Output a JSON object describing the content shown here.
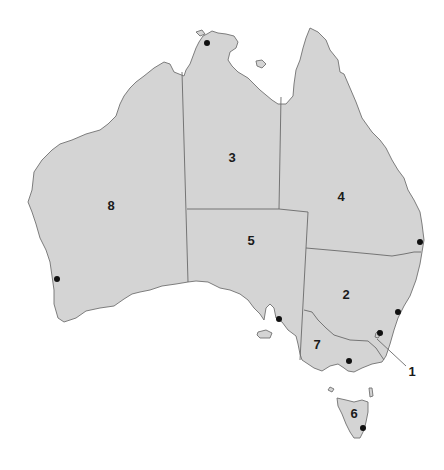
{
  "map": {
    "title": "Australia states and territories",
    "colors": {
      "land": "#d4d4d4",
      "border": "#6a6a6a",
      "city": "#111111",
      "background": "#ffffff"
    },
    "regions": [
      {
        "number": "1",
        "name": "Australian Capital Territory",
        "label_x": 383,
        "label_y": 369
      },
      {
        "number": "2",
        "name": "New South Wales",
        "label_x": 346,
        "label_y": 294
      },
      {
        "number": "3",
        "name": "Northern Territory",
        "label_x": 232,
        "label_y": 157
      },
      {
        "number": "4",
        "name": "Queensland",
        "label_x": 341,
        "label_y": 196
      },
      {
        "number": "5",
        "name": "South Australia",
        "label_x": 251,
        "label_y": 240
      },
      {
        "number": "6",
        "name": "Tasmania",
        "label_x": 354,
        "label_y": 413
      },
      {
        "number": "7",
        "name": "Victoria",
        "label_x": 317,
        "label_y": 344
      },
      {
        "number": "8",
        "name": "Western Australia",
        "label_x": 111,
        "label_y": 205
      }
    ],
    "capitals": [
      {
        "name": "Darwin",
        "x": 207,
        "y": 43
      },
      {
        "name": "Perth",
        "x": 57,
        "y": 279
      },
      {
        "name": "Adelaide",
        "x": 279,
        "y": 319
      },
      {
        "name": "Brisbane",
        "x": 420,
        "y": 242
      },
      {
        "name": "Sydney",
        "x": 398,
        "y": 312
      },
      {
        "name": "Canberra",
        "x": 380,
        "y": 333
      },
      {
        "name": "Melbourne",
        "x": 349,
        "y": 361
      },
      {
        "name": "Hobart",
        "x": 363,
        "y": 428
      }
    ]
  }
}
